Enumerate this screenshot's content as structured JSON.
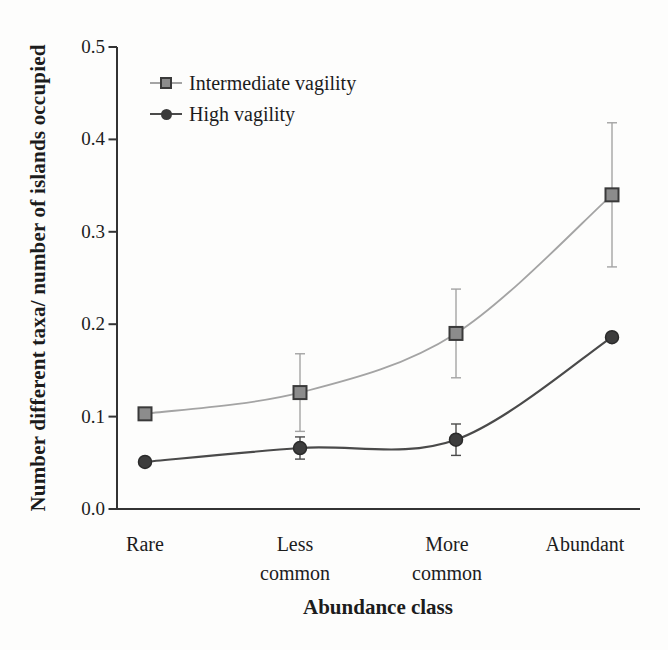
{
  "chart_data": {
    "type": "line",
    "title": "",
    "xlabel": "Abundance class",
    "ylabel": "Number different taxa/ number of islands occupied",
    "categories": [
      "Rare",
      "Less common",
      "More common",
      "Abundant"
    ],
    "y_ticks": [
      "0.5",
      "0.4",
      "0.3",
      "0.2",
      "0.1",
      "0.0"
    ],
    "ylim": [
      0.0,
      0.5
    ],
    "grid": false,
    "legend_position": "inside-top-left",
    "series": [
      {
        "name": "Intermediate vagility",
        "marker": "square",
        "color": "#a4a4a4",
        "marker_fill": "#8c8c8c",
        "marker_stroke": "#3a3a3a",
        "values": [
          0.103,
          0.126,
          0.19,
          0.34
        ],
        "error": [
          0,
          0.042,
          0.048,
          0.078
        ]
      },
      {
        "name": "High vagility",
        "marker": "circle",
        "color": "#4a4a4a",
        "marker_fill": "#3d3d3d",
        "marker_stroke": "#2b2b2b",
        "values": [
          0.051,
          0.066,
          0.075,
          0.186
        ],
        "error": [
          0,
          0.012,
          0.017,
          0
        ]
      }
    ],
    "colors": {
      "axis": "#333333",
      "text": "#1c1c1c",
      "background": "#fdfdfc"
    }
  }
}
